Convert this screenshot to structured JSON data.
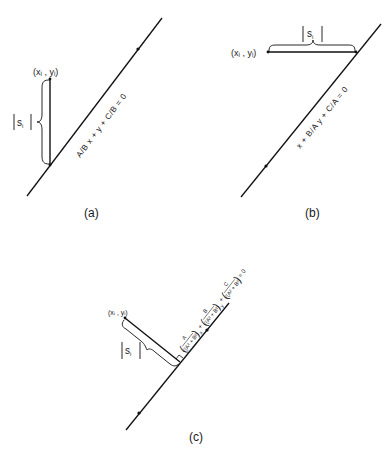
{
  "figure": {
    "panels": [
      {
        "id": "a",
        "caption": "(a)",
        "point_label": "(xᵢ , yᵢ)",
        "distance_label": "s",
        "distance_subscript": "i",
        "equation": "A/B x + y + C/B = 0",
        "distance_direction": "vertical"
      },
      {
        "id": "b",
        "caption": "(b)",
        "point_label": "(xᵢ , yᵢ)",
        "distance_label": "s",
        "distance_subscript": "i",
        "equation": "x + B/A y + C/A = 0",
        "distance_direction": "horizontal"
      },
      {
        "id": "c",
        "caption": "(c)",
        "point_label": "(xᵢ , yᵢ)",
        "distance_label": "s",
        "distance_subscript": "i",
        "equation_terms": [
          {
            "numerator": "A",
            "denominator": "√(A² + B²)",
            "variable": "x"
          },
          {
            "numerator": "B",
            "denominator": "√(A² + B²)",
            "variable": "y"
          },
          {
            "numerator": "C",
            "denominator": "√(A² + B²)",
            "variable": ""
          }
        ],
        "equation_plus": "+",
        "equation_rhs": "= 0",
        "distance_direction": "perpendicular"
      }
    ]
  }
}
